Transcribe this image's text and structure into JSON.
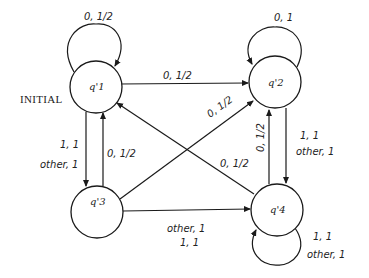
{
  "diagram": {
    "type": "state-machine",
    "initial_label": "INITIAL",
    "states": [
      {
        "id": "q1",
        "label": "q'1",
        "initial": true
      },
      {
        "id": "q2",
        "label": "q'2"
      },
      {
        "id": "q3",
        "label": "q'3"
      },
      {
        "id": "q4",
        "label": "q'4"
      }
    ],
    "transitions": [
      {
        "from": "q1",
        "to": "q1",
        "label": "0, 1/2"
      },
      {
        "from": "q2",
        "to": "q2",
        "label": "0, 1"
      },
      {
        "from": "q1",
        "to": "q2",
        "label": "0, 1/2"
      },
      {
        "from": "q3",
        "to": "q2",
        "label": "0, 1/2"
      },
      {
        "from": "q4",
        "to": "q1",
        "label": "0, 1/2"
      },
      {
        "from": "q1",
        "to": "q3",
        "label_line1": "1, 1",
        "label_line2": "other, 1"
      },
      {
        "from": "q3",
        "to": "q1",
        "label": "0, 1/2"
      },
      {
        "from": "q4",
        "to": "q2",
        "label": "0, 1/2"
      },
      {
        "from": "q2",
        "to": "q4",
        "label_line1": "1, 1",
        "label_line2": "other, 1"
      },
      {
        "from": "q3",
        "to": "q4",
        "label_line1": "other, 1",
        "label_line2": "1, 1"
      },
      {
        "from": "q4",
        "to": "q4",
        "label_line1": "1, 1",
        "label_line2": "other, 1"
      }
    ]
  }
}
